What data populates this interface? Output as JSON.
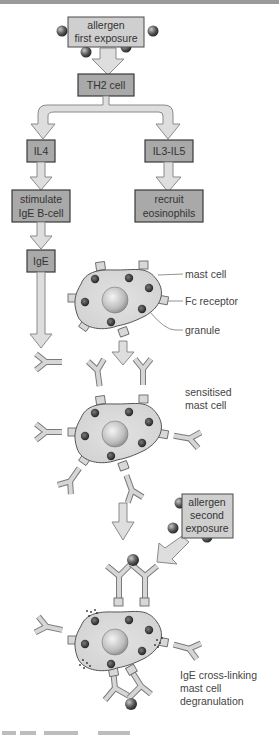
{
  "flow": {
    "allergen_first": [
      "allergen",
      "first exposure"
    ],
    "th2": "TH2 cell",
    "il4": "IL4",
    "il3_il5": "IL3-IL5",
    "stimulate": [
      "stimulate",
      "IgE B-cell"
    ],
    "recruit": [
      "recruit",
      "eosinophils"
    ],
    "ige": "IgE",
    "allergen_second": [
      "allergen",
      "second",
      "exposure"
    ]
  },
  "labels": {
    "mast_cell": "mast cell",
    "fc_receptor": "Fc receptor",
    "granule": "granule",
    "sensitised": [
      "sensitised",
      "mast cell"
    ],
    "crosslinking": [
      "IgE cross-linking",
      "mast cell",
      "degranulation"
    ]
  },
  "colors": {
    "box_light": "#cfcfcf",
    "box_dark": "#a9a9a9",
    "arrow_fill": "#dedede",
    "cell_fill": "#d9d9d9",
    "granule": "#3a3a3a",
    "allergen_ball": "#5a5a5a"
  }
}
